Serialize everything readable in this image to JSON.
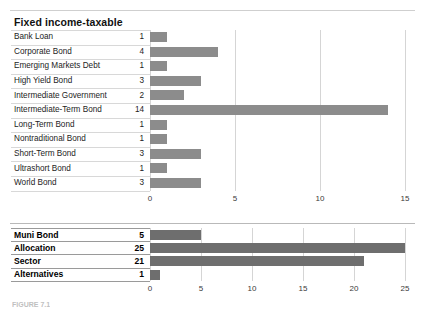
{
  "figure": {
    "title": "Fixed income-taxable",
    "caption": "FIGURE 7.1"
  },
  "chart_data": [
    {
      "id": "fixed-income-taxable",
      "type": "bar",
      "orientation": "horizontal",
      "title": "Fixed income-taxable",
      "xlabel": "",
      "ylabel": "",
      "xlim": [
        0,
        15
      ],
      "xticks": [
        0,
        5,
        10,
        15
      ],
      "xtick_labels": [
        "0",
        "5",
        "10",
        "15"
      ],
      "grid": true,
      "legend": false,
      "bar_color": "#8c8c8c",
      "categories": [
        "Bank Loan",
        "Corporate Bond",
        "Emerging Markets Debt",
        "High Yield Bond",
        "Intermediate Government",
        "Intermediate-Term Bond",
        "Long-Term Bond",
        "Nontraditional Bond",
        "Short-Term Bond",
        "Ultrashort Bond",
        "World Bond"
      ],
      "values": [
        1,
        4,
        1,
        3,
        2,
        14,
        1,
        1,
        3,
        1,
        3
      ],
      "value_labels": [
        "1",
        "4",
        "1",
        "3",
        "2",
        "14",
        "1",
        "1",
        "3",
        "1",
        "3"
      ]
    },
    {
      "id": "other-categories",
      "type": "bar",
      "orientation": "horizontal",
      "title": "",
      "xlabel": "",
      "ylabel": "",
      "xlim": [
        0,
        25
      ],
      "xticks": [
        0,
        5,
        10,
        15,
        20,
        25
      ],
      "xtick_labels": [
        "0",
        "5",
        "10",
        "15",
        "20",
        "25"
      ],
      "grid": true,
      "legend": false,
      "bar_color": "#6e6e6e",
      "categories": [
        "Muni Bond",
        "Allocation",
        "Sector",
        "Alternatives"
      ],
      "values": [
        5,
        25,
        21,
        1
      ],
      "value_labels": [
        "5",
        "25",
        "21",
        "1"
      ]
    }
  ]
}
